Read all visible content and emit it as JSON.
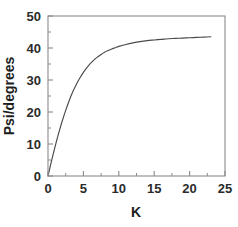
{
  "chart_data": {
    "type": "line",
    "title": "",
    "xlabel": "K",
    "ylabel": "Psi/degrees",
    "xlim": [
      0,
      25
    ],
    "ylim": [
      0,
      50
    ],
    "xticks": [
      0,
      5,
      10,
      15,
      20,
      25
    ],
    "xtick_labels": [
      "0",
      "5",
      "10",
      "15",
      "20",
      "25"
    ],
    "yticks": [
      0,
      10,
      20,
      30,
      40,
      50
    ],
    "ytick_labels": [
      "0",
      "10",
      "20",
      "30",
      "40",
      "50"
    ],
    "x_minor_interval": 2.5,
    "y_minor_interval": 5,
    "grid": false,
    "legend": false,
    "frame": "box",
    "tick_direction": "in",
    "line_color": "#4a4a4a",
    "axis_color": "#8a8a8a",
    "background_color": "#ffffff",
    "series": [
      {
        "name": "Psi vs K",
        "x": [
          0,
          0.5,
          1,
          1.5,
          2,
          2.5,
          3,
          3.5,
          4,
          4.5,
          5,
          5.5,
          6,
          6.5,
          7,
          7.5,
          8,
          8.5,
          9,
          9.5,
          10,
          11,
          12,
          13,
          14,
          15,
          16,
          17,
          18,
          19,
          20,
          21,
          22,
          23
        ],
        "values": [
          0,
          4.7,
          9.2,
          13.3,
          17.1,
          20.5,
          23.6,
          26.3,
          28.6,
          30.6,
          32.4,
          33.9,
          35.2,
          36.3,
          37.2,
          38.0,
          38.7,
          39.2,
          39.7,
          40.1,
          40.5,
          41.1,
          41.6,
          42.0,
          42.3,
          42.5,
          42.7,
          42.9,
          43.0,
          43.1,
          43.2,
          43.3,
          43.4,
          43.5
        ]
      }
    ]
  },
  "figure": {
    "xlabel": "K",
    "ylabel": "Psi/degrees"
  }
}
